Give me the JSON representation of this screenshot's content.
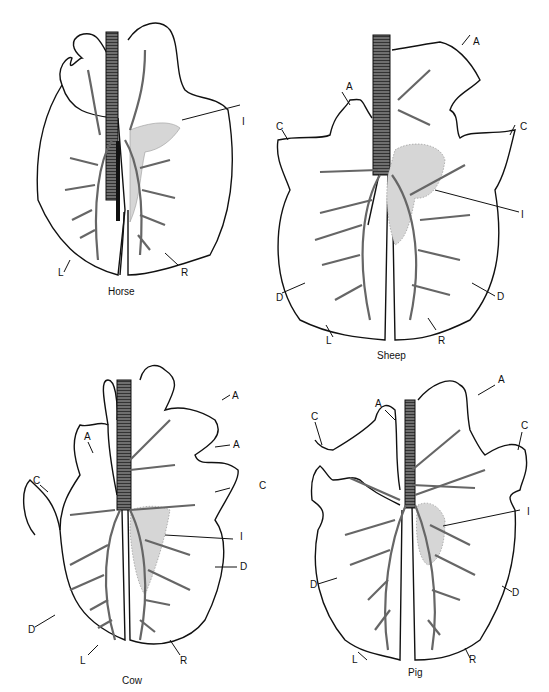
{
  "figure": {
    "panels": [
      {
        "species": "Horse",
        "labels": {
          "I": "I",
          "L": "L",
          "R": "R"
        }
      },
      {
        "species": "Sheep",
        "labels": {
          "A1": "A",
          "A2": "A",
          "C1": "C",
          "C2": "C",
          "I": "I",
          "D1": "D",
          "D2": "D",
          "L": "L",
          "R": "R"
        }
      },
      {
        "species": "Cow",
        "labels": {
          "A1": "A",
          "A2": "A",
          "A3": "A",
          "C1": "C",
          "C2": "C",
          "I": "I",
          "D1": "D",
          "D2": "D",
          "L": "L",
          "R": "R"
        }
      },
      {
        "species": "Pig",
        "labels": {
          "A1": "A",
          "A2": "A",
          "C1": "C",
          "C2": "C",
          "I": "I",
          "D1": "D",
          "D2": "D",
          "L": "L",
          "R": "R"
        }
      }
    ],
    "colors": {
      "outline": "#111111",
      "shading": "#d6d6d6",
      "background": "#ffffff"
    }
  }
}
